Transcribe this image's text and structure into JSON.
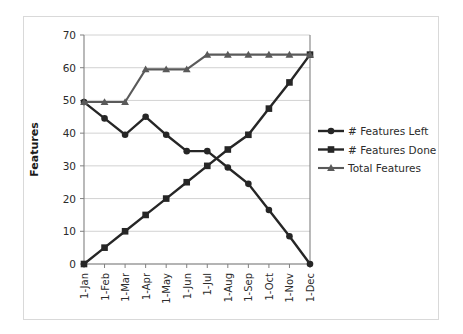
{
  "chart_data": {
    "type": "line",
    "title": "",
    "subtitle": "",
    "xlabel": "",
    "ylabel": "Features",
    "categories": [
      "1-Jan",
      "1-Feb",
      "1-Mar",
      "1-Apr",
      "1-May",
      "1-Jun",
      "1-Jul",
      "1-Aug",
      "1-Sep",
      "1-Oct",
      "1-Nov",
      "1-Dec"
    ],
    "ylim": [
      0,
      70
    ],
    "yticks": [
      0,
      10,
      20,
      30,
      40,
      50,
      60,
      70
    ],
    "grid": "horizontal",
    "legend_position": "right",
    "series": [
      {
        "name": "# Features Left",
        "marker": "circle",
        "color": "#262626",
        "values": [
          49.5,
          44.5,
          39.5,
          45,
          39.5,
          34.5,
          34.5,
          29.5,
          24.5,
          16.5,
          8.5,
          0
        ]
      },
      {
        "name": "# Features Done",
        "marker": "square",
        "color": "#262626",
        "values": [
          0,
          5,
          10,
          15,
          20,
          25,
          30,
          35,
          39.5,
          47.5,
          55.5,
          64
        ]
      },
      {
        "name": "Total Features",
        "marker": "triangle",
        "color": "#5a5a5a",
        "values": [
          49.5,
          49.5,
          49.5,
          59.5,
          59.5,
          59.5,
          64,
          64,
          64,
          64,
          64,
          64
        ]
      }
    ]
  },
  "legend": {
    "items": [
      {
        "label": "# Features Left",
        "marker": "circle"
      },
      {
        "label": "# Features Done",
        "marker": "square"
      },
      {
        "label": "Total Features",
        "marker": "triangle"
      }
    ]
  },
  "axes": {
    "y_title": "Features",
    "y_tick_labels": [
      "70",
      "60",
      "50",
      "40",
      "30",
      "20",
      "10",
      "0"
    ],
    "x_tick_labels": [
      "1-Jan",
      "1-Feb",
      "1-Mar",
      "1-Apr",
      "1-May",
      "1-Jun",
      "1-Jul",
      "1-Aug",
      "1-Sep",
      "1-Oct",
      "1-Nov",
      "1-Dec"
    ]
  },
  "colors": {
    "series_dark": "#262626",
    "series_grey": "#5a5a5a",
    "gridline": "#c7c7c7",
    "axis": "#808080",
    "frame": "#d9d9d9",
    "text": "#2b2b2b",
    "background": "#ffffff"
  }
}
